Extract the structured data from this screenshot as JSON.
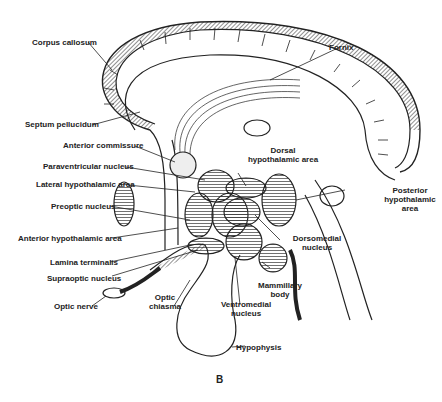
{
  "figure": {
    "panel_letter": "B",
    "labels": {
      "corpus_callosum": "Corpus callosum",
      "fornix": "Fornix",
      "septum_pellucidum": "Septum pellucidum",
      "anterior_commissure": "Anterior commissure",
      "dorsal_hypothalamic_area_1": "Dorsal",
      "dorsal_hypothalamic_area_2": "hypothalamic area",
      "paraventricular_nucleus": "Paraventricular nucleus",
      "lateral_hypothalamic_area": "Lateral hypothalamic area",
      "preoptic_nucleus": "Preoptic nucleus",
      "posterior_hypothalamic_area_1": "Posterior",
      "posterior_hypothalamic_area_2": "hypothalamic",
      "posterior_hypothalamic_area_3": "area",
      "anterior_hypothalamic_area": "Anterior hypothalamic area",
      "dorsomedial_nucleus_1": "Dorsomedial",
      "dorsomedial_nucleus_2": "nucleus",
      "lamina_terminalis": "Lamina terminalis",
      "supraoptic_nucleus": "Supraoptic nucleus",
      "mammillary_body_1": "Mammillary",
      "mammillary_body_2": "body",
      "optic_nerve": "Optic nerve",
      "optic_chiasma_1": "Optic",
      "optic_chiasma_2": "chiasma",
      "ventromedial_nucleus_1": "Ventromedial",
      "ventromedial_nucleus_2": "nucleus",
      "hypophysis": "Hypophysis"
    }
  }
}
